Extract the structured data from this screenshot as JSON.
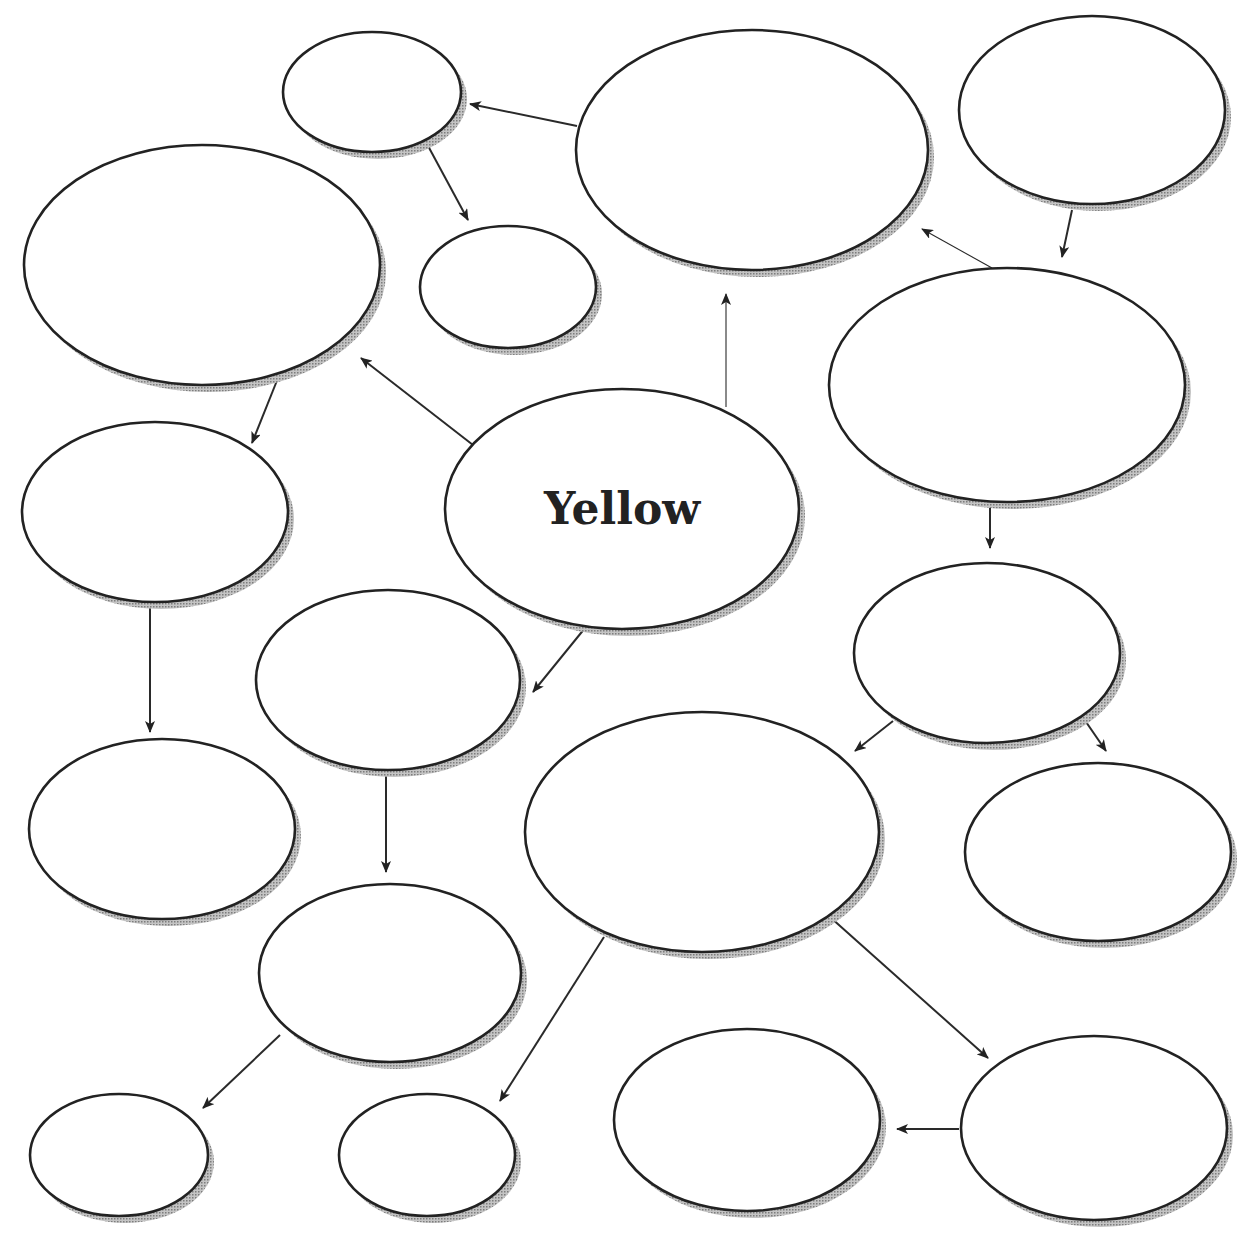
{
  "diagram": {
    "type": "concept-web",
    "center_label": "Yellow",
    "colors": {
      "stroke": "#222222",
      "shadow": "#9a9a9a",
      "fill": "#ffffff",
      "text": "#222222"
    },
    "nodes": [
      {
        "id": "n1",
        "cx": 372,
        "cy": 92,
        "rx": 89,
        "ry": 60,
        "label": ""
      },
      {
        "id": "n2",
        "cx": 752,
        "cy": 150,
        "rx": 176,
        "ry": 120,
        "label": ""
      },
      {
        "id": "n3",
        "cx": 1092,
        "cy": 110,
        "rx": 133,
        "ry": 94,
        "label": ""
      },
      {
        "id": "n4",
        "cx": 202,
        "cy": 265,
        "rx": 178,
        "ry": 120,
        "label": ""
      },
      {
        "id": "n5",
        "cx": 508,
        "cy": 287,
        "rx": 88,
        "ry": 61,
        "label": ""
      },
      {
        "id": "n6",
        "cx": 1007,
        "cy": 385,
        "rx": 178,
        "ry": 117,
        "label": ""
      },
      {
        "id": "yellow",
        "cx": 622,
        "cy": 509,
        "rx": 177,
        "ry": 120,
        "label": "Yellow"
      },
      {
        "id": "n7",
        "cx": 155,
        "cy": 512,
        "rx": 133,
        "ry": 90,
        "label": ""
      },
      {
        "id": "n8",
        "cx": 987,
        "cy": 653,
        "rx": 133,
        "ry": 90,
        "label": ""
      },
      {
        "id": "n9",
        "cx": 388,
        "cy": 680,
        "rx": 132,
        "ry": 90,
        "label": ""
      },
      {
        "id": "n10",
        "cx": 162,
        "cy": 829,
        "rx": 133,
        "ry": 90,
        "label": ""
      },
      {
        "id": "n11",
        "cx": 702,
        "cy": 832,
        "rx": 177,
        "ry": 120,
        "label": ""
      },
      {
        "id": "n12",
        "cx": 1098,
        "cy": 852,
        "rx": 133,
        "ry": 89,
        "label": ""
      },
      {
        "id": "n13",
        "cx": 390,
        "cy": 973,
        "rx": 131,
        "ry": 89,
        "label": ""
      },
      {
        "id": "n14",
        "cx": 119,
        "cy": 1155,
        "rx": 89,
        "ry": 61,
        "label": ""
      },
      {
        "id": "n15",
        "cx": 427,
        "cy": 1155,
        "rx": 88,
        "ry": 61,
        "label": ""
      },
      {
        "id": "n16",
        "cx": 747,
        "cy": 1120,
        "rx": 133,
        "ry": 91,
        "label": ""
      },
      {
        "id": "n17",
        "cx": 1094,
        "cy": 1128,
        "rx": 133,
        "ry": 92,
        "label": ""
      }
    ],
    "edges": [
      {
        "from": "n2",
        "to": "n1",
        "x1": 577,
        "y1": 126,
        "x2": 470,
        "y2": 104
      },
      {
        "from": "n1",
        "to": "n5",
        "x1": 427,
        "y1": 144,
        "x2": 468,
        "y2": 220
      },
      {
        "from": "n3",
        "to": "n6",
        "x1": 1072,
        "y1": 210,
        "x2": 1062,
        "y2": 257
      },
      {
        "from": "n6",
        "to": "n2",
        "x1": 992,
        "y1": 268,
        "x2": 922,
        "y2": 229,
        "thin": true
      },
      {
        "from": "yellow",
        "to": "n2",
        "x1": 726,
        "y1": 407,
        "x2": 726,
        "y2": 294,
        "thin": true
      },
      {
        "from": "yellow",
        "to": "n4",
        "x1": 473,
        "y1": 445,
        "x2": 361,
        "y2": 358
      },
      {
        "from": "n4",
        "to": "n7",
        "x1": 278,
        "y1": 378,
        "x2": 252,
        "y2": 443
      },
      {
        "from": "n6",
        "to": "n8",
        "x1": 990,
        "y1": 505,
        "x2": 990,
        "y2": 548
      },
      {
        "from": "yellow",
        "to": "n9",
        "x1": 585,
        "y1": 628,
        "x2": 533,
        "y2": 692
      },
      {
        "from": "n7",
        "to": "n10",
        "x1": 150,
        "y1": 604,
        "x2": 150,
        "y2": 732
      },
      {
        "from": "n8",
        "to": "n11",
        "x1": 893,
        "y1": 721,
        "x2": 855,
        "y2": 751
      },
      {
        "from": "n8",
        "to": "n12",
        "x1": 1084,
        "y1": 719,
        "x2": 1106,
        "y2": 751
      },
      {
        "from": "n9",
        "to": "n13",
        "x1": 386,
        "y1": 772,
        "x2": 386,
        "y2": 872
      },
      {
        "from": "n11",
        "to": "n15",
        "x1": 604,
        "y1": 937,
        "x2": 500,
        "y2": 1101
      },
      {
        "from": "n11",
        "to": "n17",
        "x1": 830,
        "y1": 917,
        "x2": 988,
        "y2": 1058
      },
      {
        "from": "n13",
        "to": "n14",
        "x1": 280,
        "y1": 1035,
        "x2": 203,
        "y2": 1108
      },
      {
        "from": "n17",
        "to": "n16",
        "x1": 959,
        "y1": 1129,
        "x2": 897,
        "y2": 1129
      }
    ]
  }
}
